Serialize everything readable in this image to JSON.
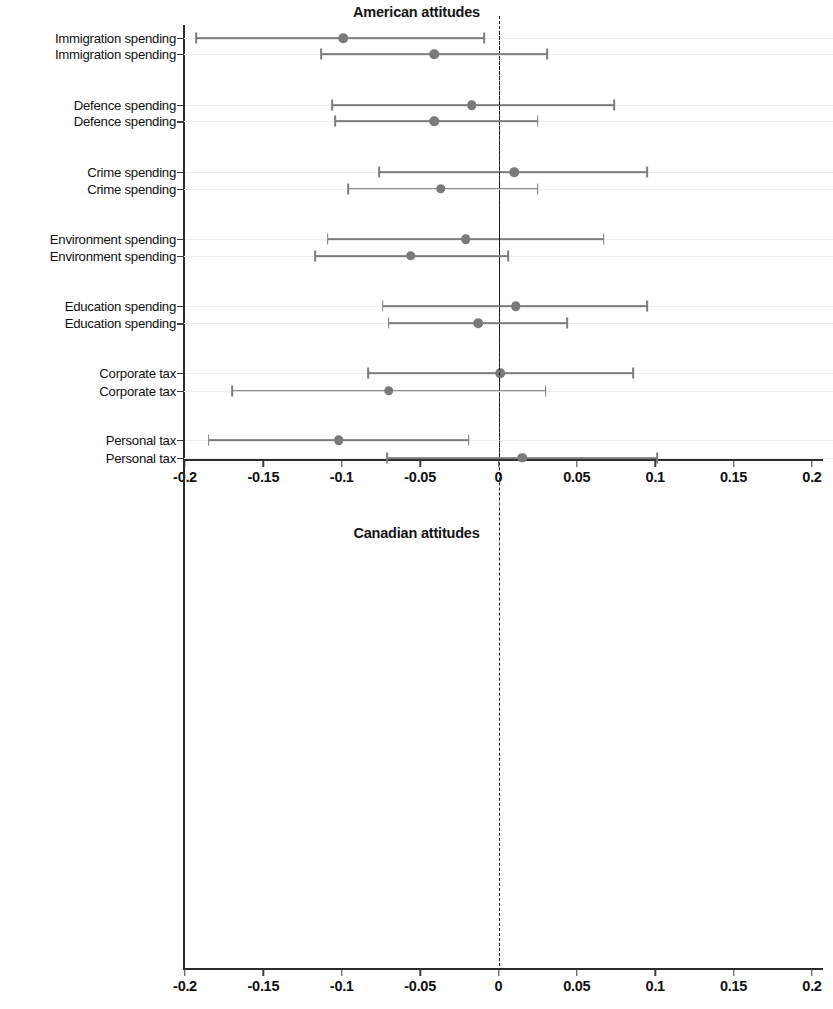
{
  "figure": {
    "panels": [
      {
        "id": "american",
        "title": "American attitudes",
        "xlabel": "",
        "ylabel": "",
        "xticks": [
          "-0.2",
          "-0.15",
          "-0.1",
          "-0.05",
          "0",
          "0.05",
          "0.1",
          "0.15",
          "0.2"
        ],
        "xtick_values": [
          -0.2,
          -0.15,
          -0.1,
          -0.05,
          0,
          0.05,
          0.1,
          0.15,
          0.2
        ],
        "xlim": [
          -0.2,
          0.2
        ],
        "zero_reference": 0,
        "rows": [
          {
            "label": "Immigration spending",
            "estimate": -0.099,
            "low": -0.193,
            "high": -0.009
          },
          {
            "label": "Defence spending",
            "estimate": -0.017,
            "low": -0.106,
            "high": 0.074
          },
          {
            "label": "Crime spending",
            "estimate": 0.01,
            "low": -0.076,
            "high": 0.095
          },
          {
            "label": "Environment spending",
            "estimate": -0.021,
            "low": -0.109,
            "high": 0.067
          },
          {
            "label": "Education spending",
            "estimate": 0.011,
            "low": -0.074,
            "high": 0.095
          },
          {
            "label": "Corporate tax",
            "estimate": 0.001,
            "low": -0.083,
            "high": 0.086
          },
          {
            "label": "Personal tax",
            "estimate": -0.102,
            "low": -0.185,
            "high": -0.019
          }
        ]
      },
      {
        "id": "canadian",
        "title": "Canadian attitudes",
        "xlabel": "",
        "ylabel": "",
        "xticks": [
          "-0.2",
          "-0.15",
          "-0.1",
          "-0.05",
          "0",
          "0.05",
          "0.1",
          "0.15",
          "0.2"
        ],
        "xtick_values": [
          -0.2,
          -0.15,
          -0.1,
          -0.05,
          0,
          0.05,
          0.1,
          0.15,
          0.2
        ],
        "xlim": [
          -0.2,
          0.2
        ],
        "zero_reference": 0,
        "rows": [
          {
            "label": "Immigration spending",
            "estimate": -0.041,
            "low": -0.113,
            "high": 0.031
          },
          {
            "label": "Defence spending",
            "estimate": -0.041,
            "low": -0.104,
            "high": 0.025
          },
          {
            "label": "Crime spending",
            "estimate": -0.037,
            "low": -0.096,
            "high": 0.025
          },
          {
            "label": "Environment spending",
            "estimate": -0.056,
            "low": -0.117,
            "high": 0.006
          },
          {
            "label": "Education spending",
            "estimate": -0.013,
            "low": -0.07,
            "high": 0.044
          },
          {
            "label": "Corporate tax",
            "estimate": -0.07,
            "low": -0.17,
            "high": 0.03
          },
          {
            "label": "Personal tax",
            "estimate": 0.015,
            "low": -0.071,
            "high": 0.101
          }
        ]
      }
    ],
    "colors": {
      "marker": "#7a7a7a",
      "interval": "#7c7c7c",
      "axis": "#2b2b2b",
      "grid": "#ededed",
      "zero_line": "#1c1c1c",
      "text": "#111111"
    }
  },
  "chart_data": [
    {
      "type": "scatter",
      "subtype": "coefficient-plot-with-error-bars",
      "title": "American attitudes",
      "xlabel": "",
      "ylabel": "",
      "xlim": [
        -0.2,
        0.2
      ],
      "xticks": [
        -0.2,
        -0.15,
        -0.1,
        -0.05,
        0,
        0.05,
        0.1,
        0.15,
        0.2
      ],
      "xtick_labels": [
        "-0.2",
        "-0.15",
        "-0.1",
        "-0.05",
        "0",
        "0.05",
        "0.1",
        "0.15",
        "0.2"
      ],
      "grid": true,
      "legend": "none",
      "annotations": [
        "dashed vertical reference line at x = 0"
      ],
      "categories": [
        "Immigration spending",
        "Defence spending",
        "Crime spending",
        "Environment spending",
        "Education spending",
        "Corporate tax",
        "Personal tax"
      ],
      "values": [
        -0.099,
        -0.017,
        0.01,
        -0.021,
        0.011,
        0.001,
        -0.102
      ],
      "ci_low": [
        -0.193,
        -0.106,
        -0.076,
        -0.109,
        -0.074,
        -0.083,
        -0.185
      ],
      "ci_high": [
        -0.009,
        0.074,
        0.095,
        0.067,
        0.095,
        0.086,
        -0.019
      ]
    },
    {
      "type": "scatter",
      "subtype": "coefficient-plot-with-error-bars",
      "title": "Canadian attitudes",
      "xlabel": "",
      "ylabel": "",
      "xlim": [
        -0.2,
        0.2
      ],
      "xticks": [
        -0.2,
        -0.15,
        -0.1,
        -0.05,
        0,
        0.05,
        0.1,
        0.15,
        0.2
      ],
      "xtick_labels": [
        "-0.2",
        "-0.15",
        "-0.1",
        "-0.05",
        "0",
        "0.05",
        "0.1",
        "0.15",
        "0.2"
      ],
      "grid": true,
      "legend": "none",
      "annotations": [
        "dashed vertical reference line at x = 0"
      ],
      "categories": [
        "Immigration spending",
        "Defence spending",
        "Crime spending",
        "Environment spending",
        "Education spending",
        "Corporate tax",
        "Personal tax"
      ],
      "values": [
        -0.041,
        -0.041,
        -0.037,
        -0.056,
        -0.013,
        -0.07,
        0.015
      ],
      "ci_low": [
        -0.113,
        -0.104,
        -0.096,
        -0.117,
        -0.07,
        -0.17,
        -0.071
      ],
      "ci_high": [
        0.031,
        0.025,
        0.025,
        0.006,
        0.044,
        0.03,
        0.101
      ]
    }
  ]
}
